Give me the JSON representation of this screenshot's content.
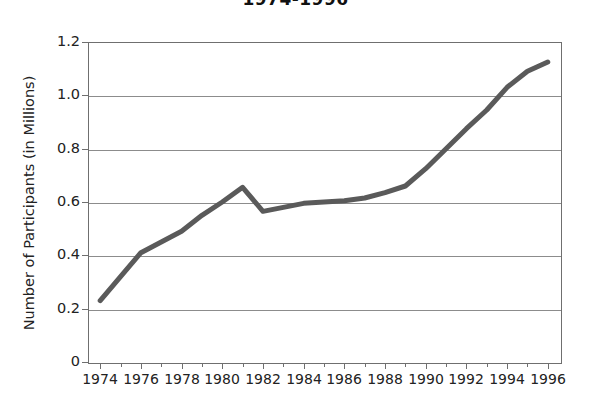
{
  "chart_data": {
    "type": "line",
    "title": "1974-1996",
    "xlabel": "",
    "ylabel": "Number of Participants (in Millions)",
    "xlim": [
      1973.4,
      1996.6
    ],
    "ylim": [
      0,
      1.2
    ],
    "grid": true,
    "legend": null,
    "line_color": "#5a5a5a",
    "line_width": 5,
    "x_tick_labels": [
      "1974",
      "1976",
      "1978",
      "1980",
      "1982",
      "1984",
      "1986",
      "1988",
      "1990",
      "1992",
      "1994",
      "1996"
    ],
    "x_tick_values": [
      1974,
      1976,
      1978,
      1980,
      1982,
      1984,
      1986,
      1988,
      1990,
      1992,
      1994,
      1996
    ],
    "x_minor_ticks": [
      1975,
      1977,
      1979,
      1981,
      1983,
      1985,
      1987,
      1989,
      1991,
      1993,
      1995
    ],
    "y_tick_labels": [
      "0",
      "0.2",
      "0.4",
      "0.6",
      "0.8",
      "1.0",
      "1.2"
    ],
    "y_tick_values": [
      0,
      0.2,
      0.4,
      0.6,
      0.8,
      1.0,
      1.2
    ],
    "x": [
      1974,
      1975,
      1976,
      1977,
      1978,
      1979,
      1980,
      1981,
      1982,
      1983,
      1984,
      1985,
      1986,
      1987,
      1988,
      1989,
      1990,
      1991,
      1992,
      1993,
      1994,
      1995,
      1996
    ],
    "values": [
      0.23,
      0.32,
      0.41,
      0.45,
      0.49,
      0.55,
      0.6,
      0.655,
      0.565,
      0.58,
      0.595,
      0.6,
      0.605,
      0.615,
      0.635,
      0.66,
      0.725,
      0.8,
      0.875,
      0.945,
      1.03,
      1.09,
      1.125
    ],
    "series": [
      {
        "name": "Number of Participants (in Millions)",
        "values": [
          0.23,
          0.32,
          0.41,
          0.45,
          0.49,
          0.55,
          0.6,
          0.655,
          0.565,
          0.58,
          0.595,
          0.6,
          0.605,
          0.615,
          0.635,
          0.66,
          0.725,
          0.8,
          0.875,
          0.945,
          1.03,
          1.09,
          1.125
        ]
      }
    ]
  }
}
